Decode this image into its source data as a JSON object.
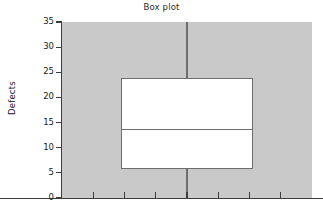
{
  "chart_data": {
    "type": "box",
    "title": "Box plot",
    "xlabel": "",
    "ylabel": "Defects",
    "ylim": [
      0,
      35
    ],
    "xlim": [
      0,
      8
    ],
    "grid": false,
    "legend": null,
    "y_ticks": [
      35,
      30,
      25,
      20,
      15,
      10,
      5,
      0
    ],
    "y_tick_labels": [
      "35",
      "30",
      "25",
      "20",
      "15",
      "10",
      "5",
      "0"
    ],
    "x_ticks": [
      1,
      2,
      3,
      4,
      5,
      6,
      7
    ],
    "x_tick_labels": [
      "",
      "",
      "",
      "",
      "",
      "",
      ""
    ],
    "boxes": [
      {
        "name": "Defects",
        "whisker_low": 0,
        "q1": 5.7,
        "median": 13.6,
        "q3": 23.8,
        "whisker_high": 35,
        "outliers": []
      }
    ],
    "colors": {
      "plot_background": "#c9c9c9",
      "figure_background": "#ffffff",
      "box_fill": "#ffffff",
      "box_edge": "#6e6e6e",
      "axis": "#3d3d3d",
      "text": "#202020"
    }
  }
}
